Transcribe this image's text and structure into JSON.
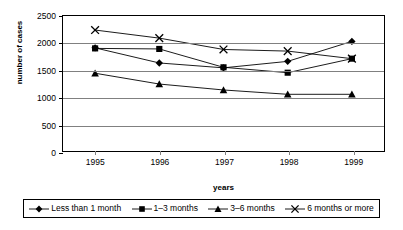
{
  "chart_data": {
    "type": "line",
    "title": "",
    "xlabel": "years",
    "ylabel": "number of cases",
    "categories": [
      "1995",
      "1996",
      "1997",
      "1998",
      "1999"
    ],
    "ylim": [
      0,
      2500
    ],
    "yticks": [
      0,
      500,
      1000,
      1500,
      2000,
      2500
    ],
    "ytick_labels": [
      "0",
      "500",
      "1000",
      "1500",
      "2000",
      "2500"
    ],
    "grid": true,
    "legend_position": "bottom",
    "series": [
      {
        "name": "Less than 1 month",
        "marker": "diamond",
        "color": "#000000",
        "values": [
          1910,
          1630,
          1540,
          1660,
          2030
        ]
      },
      {
        "name": "1–3 months",
        "marker": "square",
        "color": "#000000",
        "values": [
          1900,
          1890,
          1550,
          1450,
          1710
        ]
      },
      {
        "name": "3–6 months",
        "marker": "triangle",
        "color": "#000000",
        "values": [
          1440,
          1240,
          1130,
          1050,
          1050
        ]
      },
      {
        "name": "6 months or more",
        "marker": "cross",
        "color": "#000000",
        "values": [
          2240,
          2090,
          1880,
          1850,
          1710
        ]
      }
    ]
  },
  "axes": {
    "y_title": "number of cases",
    "x_title": "years"
  },
  "legend": {
    "items": [
      {
        "label": "Less than 1 month"
      },
      {
        "label": "1–3 months"
      },
      {
        "label": "3–6 months"
      },
      {
        "label": "6 months or more"
      }
    ]
  },
  "colors": {
    "axis": "#000000",
    "gridline": "#808080",
    "series": "#000000",
    "background": "#ffffff"
  }
}
